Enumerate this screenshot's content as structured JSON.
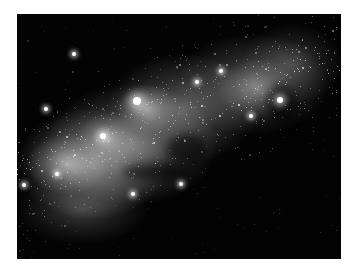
{
  "image": {
    "subject": "galaxy star field",
    "description": "Grayscale astronomical image of a dense stellar band running diagonally from lower-left to upper-right against black sky",
    "background_color": "#030303",
    "frame_color": "#ffffff"
  },
  "glows": [
    {
      "x": 0,
      "y": 95,
      "w": 150,
      "h": 110,
      "o": 0.55
    },
    {
      "x": 30,
      "y": 70,
      "w": 170,
      "h": 120,
      "o": 0.45
    },
    {
      "x": 90,
      "y": 40,
      "w": 150,
      "h": 110,
      "o": 0.4
    },
    {
      "x": 160,
      "y": 20,
      "w": 150,
      "h": 100,
      "o": 0.35
    },
    {
      "x": 225,
      "y": 10,
      "w": 100,
      "h": 80,
      "o": 0.25
    },
    {
      "x": 10,
      "y": 120,
      "w": 80,
      "h": 60,
      "o": 0.55
    },
    {
      "x": 100,
      "y": 70,
      "w": 60,
      "h": 50,
      "o": 0.55
    },
    {
      "x": 60,
      "y": 100,
      "w": 60,
      "h": 50,
      "o": 0.45
    },
    {
      "x": 200,
      "y": 45,
      "w": 80,
      "h": 60,
      "o": 0.35
    },
    {
      "x": 0,
      "y": 160,
      "w": 130,
      "h": 70,
      "o": 0.25
    }
  ],
  "lanes": [
    {
      "x": 105,
      "y": 150,
      "w": 70,
      "h": 16
    },
    {
      "x": 150,
      "y": 120,
      "w": 40,
      "h": 30
    },
    {
      "x": 250,
      "y": 70,
      "w": 30,
      "h": 40
    }
  ],
  "bright_stars": [
    {
      "x": 120,
      "y": 87,
      "r": 4
    },
    {
      "x": 86,
      "y": 122,
      "r": 3
    },
    {
      "x": 57,
      "y": 40,
      "r": 2
    },
    {
      "x": 29,
      "y": 95,
      "r": 2
    },
    {
      "x": 263,
      "y": 86,
      "r": 3
    },
    {
      "x": 164,
      "y": 170,
      "r": 2
    },
    {
      "x": 7,
      "y": 171,
      "r": 2
    },
    {
      "x": 180,
      "y": 68,
      "r": 2
    },
    {
      "x": 234,
      "y": 102,
      "r": 2
    },
    {
      "x": 116,
      "y": 180,
      "r": 2
    },
    {
      "x": 204,
      "y": 57,
      "r": 2
    },
    {
      "x": 40,
      "y": 160,
      "r": 2
    }
  ],
  "star_field": {
    "count": 650,
    "seed": 7
  }
}
